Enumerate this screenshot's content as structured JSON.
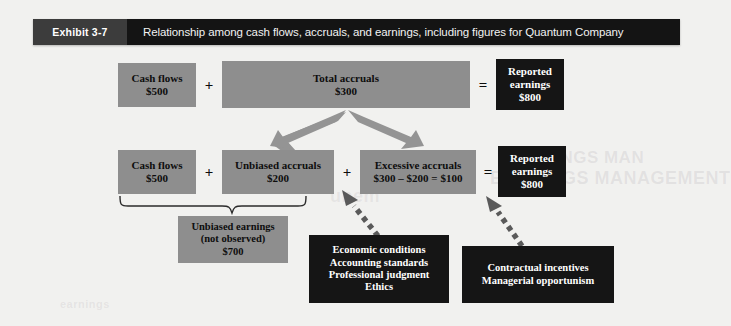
{
  "exhibit": {
    "tag": "Exhibit 3-7",
    "title": "Relationship among cash flows, accruals, and earnings, including figures for Quantum Company"
  },
  "colors": {
    "page_background": "#f1f1ef",
    "header_bar": "#141414",
    "header_tag": "#3c3c3c",
    "grey_box": "#8e8e8e",
    "dark_box": "#151515",
    "arrow_grey": "#949494",
    "dotted_arrow": "#5a5a5a"
  },
  "row1": {
    "cash_flows": {
      "label": "Cash flows",
      "value": "$500"
    },
    "operator_plus": "+",
    "total_accruals": {
      "label": "Total accruals",
      "value": "$300"
    },
    "operator_equals": "=",
    "reported_earnings": {
      "line1": "Reported",
      "line2": "earnings",
      "value": "$800"
    }
  },
  "row2": {
    "cash_flows": {
      "label": "Cash flows",
      "value": "$500"
    },
    "operator_plus_1": "+",
    "unbiased_accruals": {
      "label": "Unbiased accruals",
      "value": "$200"
    },
    "operator_plus_2": "+",
    "excessive_accruals": {
      "label": "Excessive accruals",
      "value": "$300 – $200 = $100"
    },
    "operator_equals": "=",
    "reported_earnings": {
      "line1": "Reported",
      "line2": "earnings",
      "value": "$800"
    }
  },
  "unbiased_earnings": {
    "line1": "Unbiased earnings",
    "line2": "(not observed)",
    "value": "$700"
  },
  "factors_left": {
    "items": [
      "Economic conditions",
      "Accounting standards",
      "Professional judgment",
      "Ethics"
    ]
  },
  "factors_right": {
    "items": [
      "Contractual incentives",
      "Managerial opportunism"
    ]
  },
  "ghost_text": {
    "line1": "EARNINGS MAN",
    "line2": "EARNINGS MANAGEMENT",
    "line3": "unem",
    "line4": "earnings"
  }
}
